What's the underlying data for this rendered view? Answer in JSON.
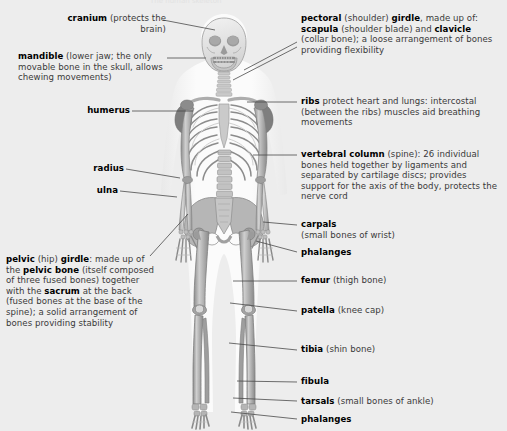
{
  "page": {
    "background_color": "#ededed",
    "figure_fill_light": "#f7f7f7",
    "bone_light": "#dcdcdc",
    "bone_mid": "#b4b4b4",
    "bone_dark": "#8f8f8f",
    "outline_color": "#6e6e6e",
    "leader_color": "#4a4a4a",
    "text_color": "#3a3a3a",
    "bold_color": "#000000",
    "cropped_header": "The human skeleton"
  },
  "labels_left": [
    {
      "id": "cranium",
      "term": "cranium",
      "rest": " (protects the brain)",
      "x": 44,
      "y": 15,
      "width": 120,
      "leader": {
        "x1": 163,
        "y1": 20,
        "x2": 215,
        "y2": 30
      }
    },
    {
      "id": "mandible",
      "term": "mandible",
      "rest": "  (lower jaw; the only movable bone in the skull, allows chewing movements)",
      "x": 18,
      "y": 53,
      "width": 148,
      "leader": {
        "x1": 167,
        "y1": 58,
        "x2": 205,
        "y2": 58
      }
    },
    {
      "id": "humerus",
      "term": "humerus",
      "rest": "",
      "x": 78,
      "y": 107,
      "width": 86,
      "leader": {
        "x1": 132,
        "y1": 111,
        "x2": 192,
        "y2": 111
      }
    },
    {
      "id": "radius",
      "term": "radius",
      "rest": "",
      "x": 90,
      "y": 165,
      "width": 74,
      "leader": {
        "x1": 126,
        "y1": 169,
        "x2": 179,
        "y2": 176
      }
    },
    {
      "id": "ulna",
      "term": "ulna",
      "rest": "",
      "x": 100,
      "y": 187,
      "width": 64,
      "leader": {
        "x1": 120,
        "y1": 191,
        "x2": 176,
        "y2": 196
      }
    },
    {
      "id": "pelvic-girdle",
      "term": "pelvic",
      "rest": " (hip) ",
      "term2": "girdle",
      "rest2": ": made up of the ",
      "term3": "pelvic bone",
      "rest3": " (itself composed of three fused bones) together with the ",
      "term4": "sacrum",
      "rest4": " at the back (fused bones at the base of the spine); a solid arrangement of bones providing stability",
      "x": 6,
      "y": 257,
      "width": 152,
      "leader": {
        "x1": 148,
        "y1": 258,
        "x2": 186,
        "y2": 215
      }
    }
  ],
  "labels_right": [
    {
      "id": "pectoral-girdle",
      "term": "pectoral",
      "rest": " (shoulder) ",
      "term2": "girdle",
      "rest2": ", made up of: ",
      "term3": "scapula",
      "rest3": " (shoulder blade) and ",
      "term4": "clavicle",
      "rest4": " (collar bone); a loose arrangement of bones providing flexibility",
      "x": 300,
      "y": 15,
      "width": 200,
      "leaders": [
        {
          "x1": 296,
          "y1": 42,
          "x2": 243,
          "y2": 68
        },
        {
          "x1": 296,
          "y1": 46,
          "x2": 232,
          "y2": 78
        }
      ]
    },
    {
      "id": "ribs",
      "term": "ribs",
      "rest": " protect heart and lungs: intercostal (between the ribs) muscles aid breathing movements",
      "x": 300,
      "y": 98,
      "width": 200,
      "leader": {
        "x1": 296,
        "y1": 102,
        "x2": 246,
        "y2": 102
      }
    },
    {
      "id": "vertebral-column",
      "term": "vertebral column",
      "rest": " (spine): 26 individual bones held together by ligaments and separated by cartilage discs; provides support for the axis of the body, protects the nerve cord",
      "x": 300,
      "y": 151,
      "width": 200,
      "leader": {
        "x1": 296,
        "y1": 155,
        "x2": 252,
        "y2": 155
      }
    },
    {
      "id": "carpals",
      "term": "carpals",
      "rest": " (small bones of wrist)",
      "x": 300,
      "y": 221,
      "width": 200,
      "leader": {
        "x1": 296,
        "y1": 225,
        "x2": 262,
        "y2": 222
      }
    },
    {
      "id": "phalanges-hand",
      "term": "phalanges",
      "rest": "",
      "x": 300,
      "y": 249,
      "width": 200,
      "leader": {
        "x1": 296,
        "y1": 252,
        "x2": 255,
        "y2": 241
      }
    },
    {
      "id": "femur",
      "term": "femur",
      "rest": " (thigh bone)",
      "x": 300,
      "y": 277,
      "width": 200,
      "leader": {
        "x1": 296,
        "y1": 281,
        "x2": 232,
        "y2": 281
      }
    },
    {
      "id": "patella",
      "term": "patella",
      "rest": " (knee cap)",
      "x": 300,
      "y": 307,
      "width": 200,
      "leader": {
        "x1": 296,
        "y1": 311,
        "x2": 229,
        "y2": 303
      }
    },
    {
      "id": "tibia",
      "term": "tibia",
      "rest": " (shin bone)",
      "x": 300,
      "y": 346,
      "width": 200,
      "leader": {
        "x1": 296,
        "y1": 350,
        "x2": 228,
        "y2": 342
      }
    },
    {
      "id": "fibula",
      "term": "fibula",
      "rest": "",
      "x": 300,
      "y": 378,
      "width": 200,
      "leader": {
        "x1": 296,
        "y1": 382,
        "x2": 236,
        "y2": 380
      }
    },
    {
      "id": "tarsals",
      "term": "tarsals",
      "rest": " (small bones of ankle)",
      "x": 300,
      "y": 398,
      "width": 200,
      "leader": {
        "x1": 296,
        "y1": 401,
        "x2": 232,
        "y2": 398
      }
    },
    {
      "id": "phalanges-foot",
      "term": "phalanges",
      "rest": "",
      "x": 300,
      "y": 416,
      "width": 200,
      "leader": {
        "x1": 296,
        "y1": 419,
        "x2": 230,
        "y2": 411
      }
    }
  ]
}
